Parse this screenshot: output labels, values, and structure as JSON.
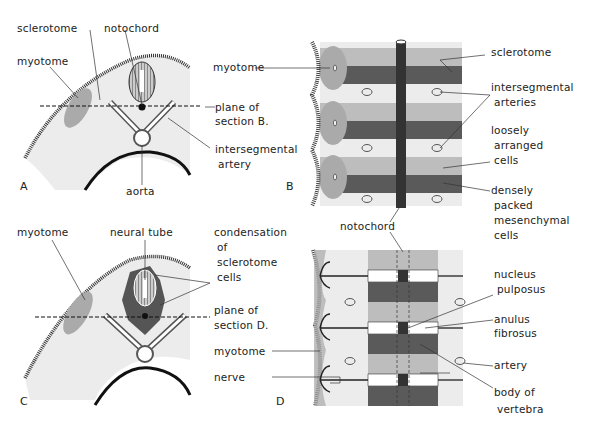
{
  "panels": {
    "A": {
      "letter": "A",
      "labels": {
        "sclerotome": "sclerotome",
        "notochord": "notochord",
        "myotome": "myotome",
        "plane1": "plane of",
        "plane2": "section B.",
        "interseg1": "intersegmental",
        "interseg2": "artery",
        "aorta": "aorta"
      }
    },
    "B": {
      "letter": "B",
      "labels": {
        "myotome": "myotome",
        "sclerotome": "sclerotome",
        "arteries1": "intersegmental",
        "arteries2": "arteries",
        "loose1": "loosely",
        "loose2": "arranged",
        "loose3": "cells",
        "dense1": "densely",
        "dense2": "packed",
        "dense3": "mesenchymal",
        "dense4": "cells",
        "notochord": "notochord"
      }
    },
    "C": {
      "letter": "C",
      "labels": {
        "myotome": "myotome",
        "neural_tube": "neural tube",
        "cond1": "condensation",
        "cond2": "of",
        "cond3": "sclerotome",
        "cond4": "cells",
        "plane1": "plane of",
        "plane2": "section D."
      }
    },
    "D": {
      "letter": "D",
      "labels": {
        "myotome": "myotome",
        "nerve": "nerve",
        "nucleus1": "nucleus",
        "nucleus2": "pulposus",
        "anulus1": "anulus",
        "anulus2": "fibrosus",
        "artery": "artery",
        "body1": "body of",
        "body2": "vertebra"
      }
    }
  },
  "colors": {
    "light": "#e8e8e8",
    "mid": "#b4b4b4",
    "dark": "#555555",
    "line": "#222222"
  }
}
